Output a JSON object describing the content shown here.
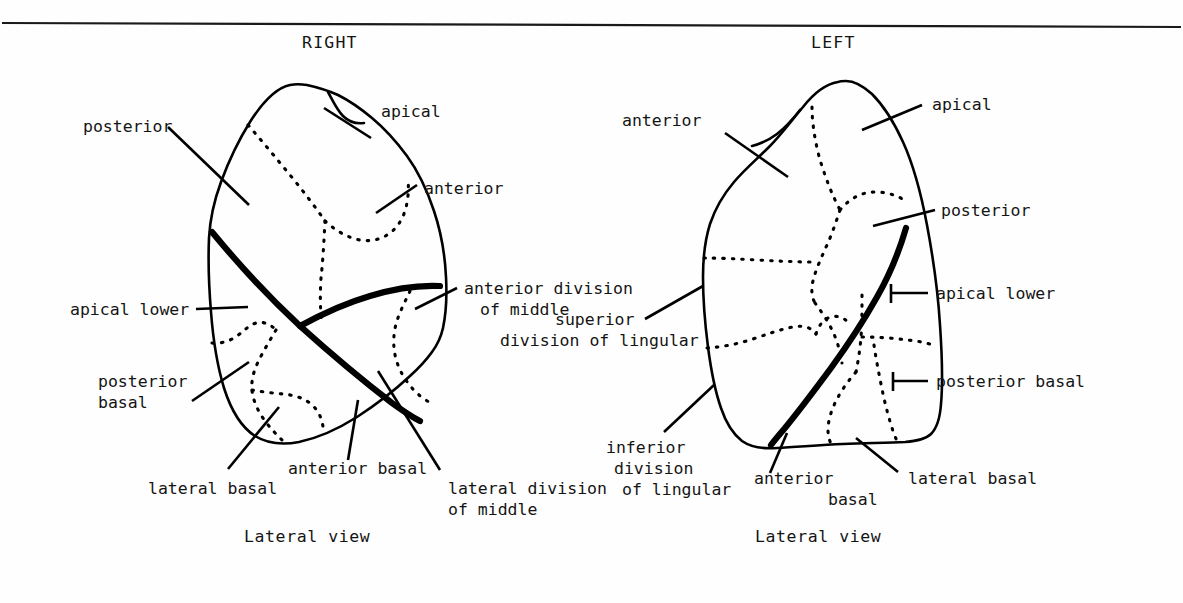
{
  "figure": {
    "type": "anatomical-diagram",
    "rule_present": true
  },
  "panels": [
    {
      "id": "right",
      "side_title": "RIGHT",
      "caption": "Lateral view",
      "labels": [
        {
          "id": "r-posterior",
          "text": "posterior"
        },
        {
          "id": "r-apical",
          "text": "apical"
        },
        {
          "id": "r-anterior",
          "text": "anterior"
        },
        {
          "id": "r-apical-lower",
          "text": "apical lower"
        },
        {
          "id": "r-ant-div-mid-1",
          "text": "anterior division"
        },
        {
          "id": "r-ant-div-mid-2",
          "text": "of middle"
        },
        {
          "id": "r-posterior-basal-1",
          "text": "posterior"
        },
        {
          "id": "r-posterior-basal-2",
          "text": "basal"
        },
        {
          "id": "r-lateral-basal",
          "text": "lateral basal"
        },
        {
          "id": "r-anterior-basal",
          "text": "anterior basal"
        },
        {
          "id": "r-lat-div-mid-1",
          "text": "lateral division"
        },
        {
          "id": "r-lat-div-mid-2",
          "text": "of middle"
        }
      ]
    },
    {
      "id": "left",
      "side_title": "LEFT",
      "caption": "Lateral view",
      "labels": [
        {
          "id": "l-anterior",
          "text": "anterior"
        },
        {
          "id": "l-apical",
          "text": "apical"
        },
        {
          "id": "l-posterior",
          "text": "posterior"
        },
        {
          "id": "l-apical-lower",
          "text": "apical lower"
        },
        {
          "id": "l-sup-div-ling-1",
          "text": "superior"
        },
        {
          "id": "l-sup-div-ling-2",
          "text": "division of lingular"
        },
        {
          "id": "l-posterior-basal",
          "text": "posterior basal"
        },
        {
          "id": "l-inf-div-ling-1",
          "text": "inferior"
        },
        {
          "id": "l-inf-div-ling-2",
          "text": "division"
        },
        {
          "id": "l-inf-div-ling-3",
          "text": "of lingular"
        },
        {
          "id": "l-anterior-basal-1",
          "text": "anterior"
        },
        {
          "id": "l-anterior-basal-2",
          "text": "basal"
        },
        {
          "id": "l-lateral-basal",
          "text": "lateral basal"
        }
      ]
    }
  ],
  "colors": {
    "ink": "#141414",
    "paper": "#fefefe",
    "fissure": "#000000"
  }
}
